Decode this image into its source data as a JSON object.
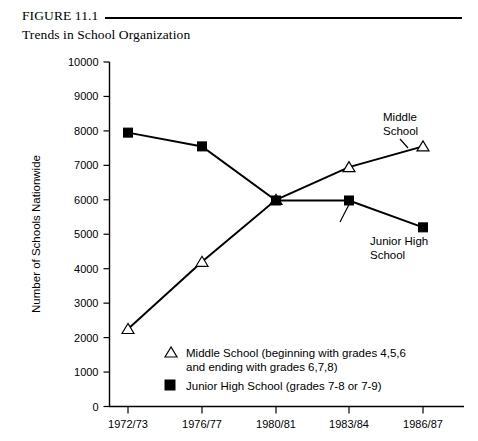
{
  "figure": {
    "number": "FIGURE 11.1",
    "subtitle": "Trends in School Organization"
  },
  "annotations": {
    "middle_school_line1": "Middle",
    "middle_school_line2": "School",
    "junior_high_line1": "Junior High",
    "junior_high_line2": "School"
  },
  "legend": {
    "middle_school_line1": "Middle School (beginning with grades 4,5,6",
    "middle_school_line2": "and ending with grades 6,7,8)",
    "junior_high_line1": "Junior High School (grades 7-8 or 7-9)",
    "middle_school_marker": "open-triangle-marker",
    "junior_high_marker": "filled-square-marker"
  },
  "chart_data": {
    "type": "line",
    "title": "Trends in School Organization",
    "xlabel": "",
    "ylabel": "Number of Schools Nationwide",
    "categories": [
      "1972/73",
      "1976/77",
      "1980/81",
      "1983/84",
      "1986/87"
    ],
    "series": [
      {
        "name": "Middle School",
        "marker": "open-triangle",
        "values": [
          2250,
          4200,
          6000,
          6950,
          7550
        ]
      },
      {
        "name": "Junior High School",
        "marker": "filled-square",
        "values": [
          7950,
          7550,
          5980,
          5980,
          5200
        ]
      }
    ],
    "ylim": [
      0,
      10000
    ],
    "ytick_labels": [
      "0",
      "1000",
      "2000",
      "3000",
      "4000",
      "5000",
      "6000",
      "7000",
      "8000",
      "9000",
      "10000"
    ],
    "ytick_values": [
      0,
      1000,
      2000,
      3000,
      4000,
      5000,
      6000,
      7000,
      8000,
      9000,
      10000
    ],
    "grid": false,
    "legend_position": "inside-bottom-left"
  }
}
